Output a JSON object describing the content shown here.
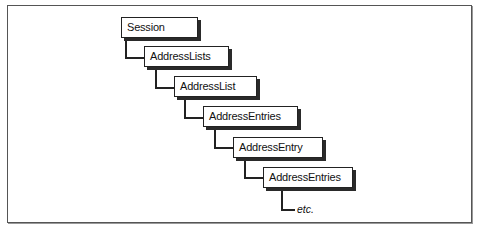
{
  "diagram": {
    "nodes": [
      {
        "label": "Session"
      },
      {
        "label": "AddressLists"
      },
      {
        "label": "AddressList"
      },
      {
        "label": "AddressEntries"
      },
      {
        "label": "AddressEntry"
      },
      {
        "label": "AddressEntries"
      }
    ],
    "continuation": "etc."
  }
}
